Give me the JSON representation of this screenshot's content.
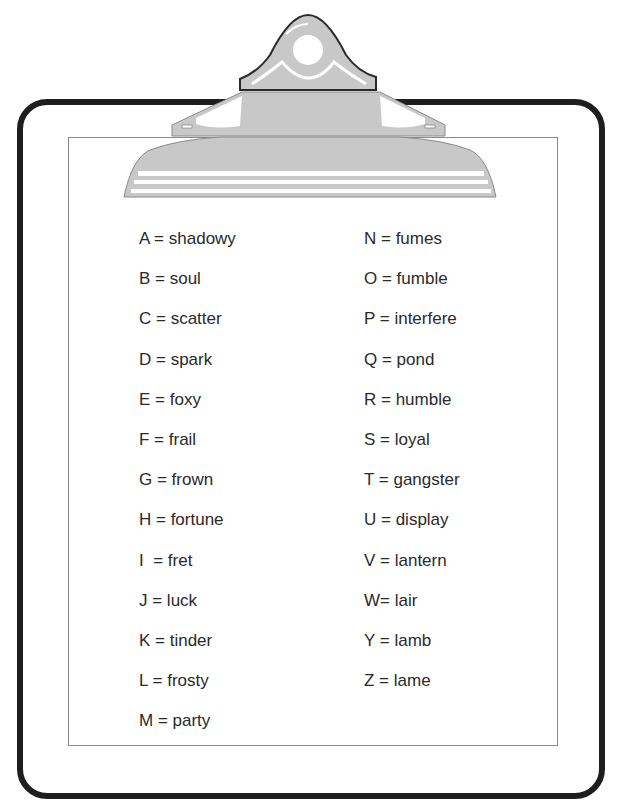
{
  "colors": {
    "board_border": "#1e1e1e",
    "paper_border": "#8a8a8a",
    "clip_fill": "#c8c8c8",
    "clip_outline": "#2a2a2a",
    "text": "#2a2a2a"
  },
  "key": {
    "left_column": [
      {
        "letter": "A",
        "text": "A = shadowy"
      },
      {
        "letter": "B",
        "text": "B = soul"
      },
      {
        "letter": "C",
        "text": "C = scatter"
      },
      {
        "letter": "D",
        "text": "D = spark"
      },
      {
        "letter": "E",
        "text": "E = foxy"
      },
      {
        "letter": "F",
        "text": "F = frail"
      },
      {
        "letter": "G",
        "text": "G = frown"
      },
      {
        "letter": "H",
        "text": "H = fortune"
      },
      {
        "letter": "I",
        "text": "I  = fret"
      },
      {
        "letter": "J",
        "text": "J = luck"
      },
      {
        "letter": "K",
        "text": "K = tinder"
      },
      {
        "letter": "L",
        "text": "L = frosty"
      },
      {
        "letter": "M",
        "text": "M = party"
      }
    ],
    "right_column": [
      {
        "letter": "N",
        "text": "N = fumes"
      },
      {
        "letter": "O",
        "text": "O = fumble"
      },
      {
        "letter": "P",
        "text": "P = interfere"
      },
      {
        "letter": "Q",
        "text": "Q = pond"
      },
      {
        "letter": "R",
        "text": "R = humble"
      },
      {
        "letter": "S",
        "text": "S = loyal"
      },
      {
        "letter": "T",
        "text": "T = gangster"
      },
      {
        "letter": "U",
        "text": "U = display"
      },
      {
        "letter": "V",
        "text": "V = lantern"
      },
      {
        "letter": "W",
        "text": "W= lair"
      },
      {
        "letter": "Y",
        "text": "Y = lamb"
      },
      {
        "letter": "Z",
        "text": "Z = lame"
      }
    ]
  }
}
